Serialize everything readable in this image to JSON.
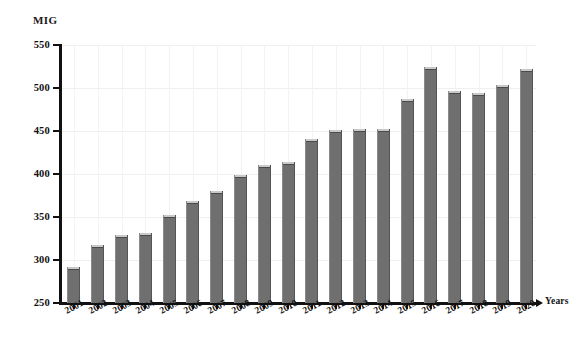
{
  "chart_data": {
    "type": "bar",
    "title": "",
    "subtitle": "",
    "xlabel": "Years",
    "ylabel": "MIG",
    "ylim": [
      250,
      550
    ],
    "ytick_step": 50,
    "yticks": [
      250,
      300,
      350,
      400,
      450,
      500,
      550
    ],
    "ytick_labels": [
      "250",
      "300",
      "350",
      "400",
      "450",
      "500",
      "550"
    ],
    "grid": true,
    "legend": null,
    "legend_position": "none",
    "categories": [
      "2001",
      "2002",
      "2003",
      "2004",
      "2005",
      "2006",
      "2007",
      "2008",
      "2009",
      "2010",
      "2011",
      "2012",
      "2013",
      "2014",
      "2015",
      "2016",
      "2017",
      "2018",
      "2019",
      "2020"
    ],
    "values": [
      292,
      317,
      329,
      331,
      352,
      369,
      380,
      399,
      410,
      414,
      441,
      451,
      452,
      452,
      487,
      524,
      497,
      494,
      503,
      522
    ],
    "bar_color": "#6f6f6f",
    "bar_edge_color": "#4a4a4a",
    "axis_color": "#111111",
    "background_color": "#ffffff"
  }
}
